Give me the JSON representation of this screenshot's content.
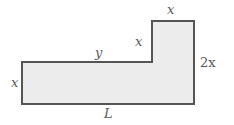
{
  "figure": {
    "name": "l-shaped-region-with-dimension-labels",
    "background_color": "#ffffff",
    "shape": {
      "type": "l-shaped-polygon",
      "fill_color": "#ececec",
      "stroke_color": "#555555",
      "stroke_width": 2,
      "vertices": [
        [
          22,
          62
        ],
        [
          152,
          62
        ],
        [
          152,
          21
        ],
        [
          194,
          21
        ],
        [
          194,
          104
        ],
        [
          22,
          104
        ]
      ]
    },
    "labels": {
      "left_height": "x",
      "top_arm_width": "y",
      "notch_height": "x",
      "top_width": "x",
      "right_height": "2x",
      "bottom_width": "L"
    },
    "label_text_color": "#5a5a5a"
  }
}
